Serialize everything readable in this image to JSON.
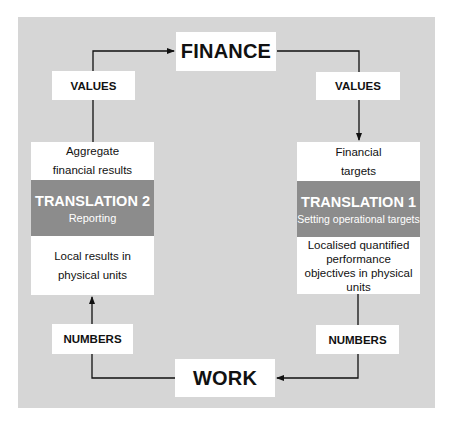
{
  "diagram": {
    "nodes": {
      "finance": {
        "label": "FINANCE"
      },
      "work": {
        "label": "WORK"
      }
    },
    "left_column": {
      "values_label": "VALUES",
      "numbers_label": "NUMBERS",
      "top_text": [
        "Aggregate",
        "financial results"
      ],
      "translation": {
        "title": "TRANSLATION 2",
        "subtitle": "Reporting"
      },
      "bottom_text": [
        "Local results in",
        "physical units"
      ]
    },
    "right_column": {
      "values_label": "VALUES",
      "numbers_label": "NUMBERS",
      "top_text": [
        "Financial",
        "targets"
      ],
      "translation": {
        "title": "TRANSLATION 1",
        "subtitle": "Setting operational targets"
      },
      "bottom_text": [
        "Localised quantified",
        "performance",
        "objectives in physical",
        "units"
      ]
    },
    "colors": {
      "panel": "#d6d6d6",
      "translation_band": "#8c8c8c",
      "box": "#ffffff",
      "line": "#111111"
    }
  }
}
